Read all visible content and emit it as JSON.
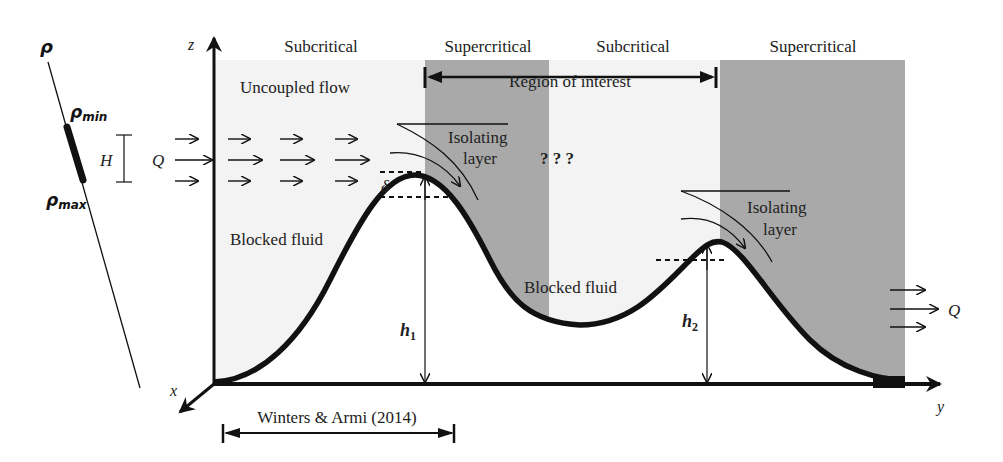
{
  "density_scale": {
    "axis_label": "ρ",
    "min_label": "ρ",
    "min_sub": "min",
    "max_label": "ρ",
    "max_sub": "max"
  },
  "depth_scale": {
    "label": "H"
  },
  "inflow": {
    "label": "Q"
  },
  "outflow": {
    "label": "Q"
  },
  "axes": {
    "z": "z",
    "x": "x",
    "y": "y"
  },
  "regimes": [
    {
      "label": "Subcritical",
      "shade": "light"
    },
    {
      "label": "Supercritical",
      "shade": "dark"
    },
    {
      "label": "Subcritical",
      "shade": "light"
    },
    {
      "label": "Supercritical",
      "shade": "dark"
    }
  ],
  "colors": {
    "light_region": "#f3f3f3",
    "dark_region": "#a9a9a9",
    "topography": "#111111"
  },
  "annotations": {
    "uncoupled_flow": "Uncoupled flow",
    "region_of_interest": "Region of interest",
    "isolating_layer_1_line1": "Isolating",
    "isolating_layer_1_line2": "layer",
    "isolating_layer_2_line1": "Isolating",
    "isolating_layer_2_line2": "layer",
    "unknown": "? ? ?",
    "blocked_fluid_1": "Blocked fluid",
    "blocked_fluid_2": "Blocked fluid",
    "delta": "δ",
    "h1": "h",
    "h1_sub": "1",
    "h2": "h",
    "h2_sub": "2",
    "reference": "Winters & Armi (2014)"
  }
}
